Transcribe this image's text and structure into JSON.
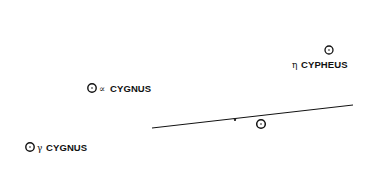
{
  "diagram": {
    "stars": [
      {
        "id": "eta-cypheus",
        "greek": "η",
        "name": "CYPHEUS",
        "cx": 329,
        "cy": 50
      },
      {
        "id": "alpha-cygnus",
        "greek": "∝",
        "name": "CYGNUS",
        "cx": 92,
        "cy": 88
      },
      {
        "id": "gamma-cygnus",
        "greek": "γ",
        "name": "CYGNUS",
        "cx": 30,
        "cy": 147
      },
      {
        "id": "unlabeled-star",
        "greek": "",
        "name": "",
        "cx": 261,
        "cy": 124
      }
    ],
    "line": {
      "x1": 152,
      "y1": 128,
      "x2": 353,
      "y2": 105,
      "tick_x": 235,
      "tick_y": 118.5
    },
    "colors": {
      "ink": "#111111",
      "background": "#ffffff"
    }
  }
}
